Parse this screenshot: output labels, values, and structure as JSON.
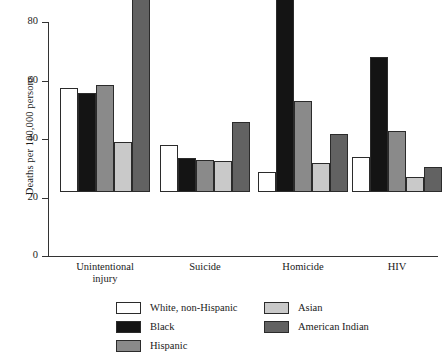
{
  "chart_data": {
    "type": "bar",
    "title": "",
    "xlabel": "",
    "ylabel": "Deaths per 100,000 persons",
    "ylim": [
      0,
      80
    ],
    "yticks": [
      0,
      20,
      40,
      60,
      80
    ],
    "grid": false,
    "legend_position": "bottom",
    "categories": [
      "Unintentional\ninjury",
      "Suicide",
      "Homicide",
      "HIV"
    ],
    "series": [
      {
        "name": "White, non-Hispanic",
        "color": "#ffffff",
        "values": [
          35.5,
          16,
          7,
          12
        ]
      },
      {
        "name": "Black",
        "color": "#141414",
        "values": [
          34,
          11.5,
          71.5,
          46
        ]
      },
      {
        "name": "Hispanic",
        "color": "#8a8a8a",
        "values": [
          36.5,
          11,
          31,
          21
        ]
      },
      {
        "name": "Asian",
        "color": "#c9c9c9",
        "values": [
          17,
          10.5,
          10,
          5
        ]
      },
      {
        "name": "American Indian",
        "color": "#626262",
        "values": [
          73.5,
          24,
          20,
          8.5
        ]
      }
    ]
  },
  "axis": {
    "y_title": "Deaths per 100,000 persons",
    "tick_labels": [
      "0",
      "20",
      "40",
      "60",
      "80"
    ]
  },
  "groups": [
    {
      "label": "Unintentional\ninjury"
    },
    {
      "label": "Suicide"
    },
    {
      "label": "Homicide"
    },
    {
      "label": "HIV"
    }
  ],
  "legend": {
    "left_column": [
      {
        "label": "White, non-Hispanic",
        "color": "#ffffff"
      },
      {
        "label": "Black",
        "color": "#141414"
      },
      {
        "label": "Hispanic",
        "color": "#8a8a8a"
      }
    ],
    "right_column": [
      {
        "label": "Asian",
        "color": "#c9c9c9"
      },
      {
        "label": "American Indian",
        "color": "#626262"
      }
    ]
  }
}
